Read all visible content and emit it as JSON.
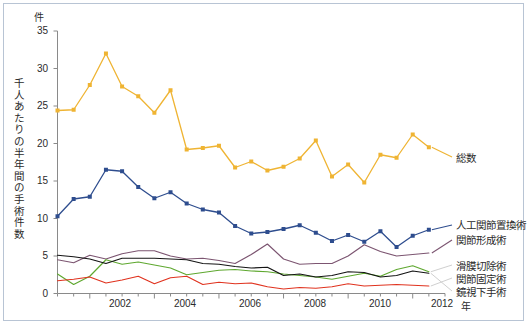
{
  "axes": {
    "unit_top": "件",
    "ylabel": "千人あたりの半年間の手術件数",
    "yticks": [
      "0",
      "5",
      "10",
      "15",
      "20",
      "25",
      "30",
      "35"
    ],
    "xticks": [
      "2002",
      "2004",
      "2006",
      "2008",
      "2010",
      "2012"
    ],
    "xunit": "年"
  },
  "legend": {
    "total": "総数",
    "arthroplasty": "人工関節置換術",
    "osteotomy": "関節形成術",
    "synovectomy": "滑膜切除術",
    "arthrodesis": "関節固定術",
    "arthroscopic": "鏡視下手術"
  },
  "colors": {
    "total": "#efb433",
    "arthroplasty": "#2e4d8e",
    "osteotomy": "#7c5571",
    "synovectomy": "#5fa830",
    "arthrodesis": "#e23川",
    "arthrodesis_hex": "#e0331f",
    "arthroscopic": "#141414",
    "frame": "#b8c4d4",
    "axis": "#8a8a8a",
    "text": "#2b2b2b"
  },
  "chart_data": {
    "type": "line",
    "title": "",
    "xlabel": "年",
    "ylabel": "千人あたりの半年間の手術件数",
    "ylim": [
      0,
      35
    ],
    "xlim": [
      2001.0,
      2013.0
    ],
    "grid": false,
    "legend_position": "right",
    "tick_interval_x": 2,
    "minor_tick_interval_x": 0.5,
    "tick_interval_y": 5,
    "x": [
      2001.0,
      2001.5,
      2002.0,
      2002.5,
      2003.0,
      2003.5,
      2004.0,
      2004.5,
      2005.0,
      2005.5,
      2006.0,
      2006.5,
      2007.0,
      2007.5,
      2008.0,
      2008.5,
      2009.0,
      2009.5,
      2010.0,
      2010.5,
      2011.0,
      2011.5,
      2012.0,
      2012.5
    ],
    "series": [
      {
        "name": "総数",
        "color": "#efb433",
        "markers": true,
        "values": [
          24.4,
          24.5,
          27.8,
          32.0,
          27.6,
          26.3,
          24.1,
          27.1,
          19.2,
          19.4,
          19.7,
          16.8,
          17.6,
          16.4,
          16.9,
          18.0,
          20.4,
          15.6,
          17.2,
          14.8,
          18.5,
          18.1,
          21.2,
          19.5
        ]
      },
      {
        "name": "人工関節置換術",
        "color": "#2e4d8e",
        "markers": true,
        "values": [
          10.3,
          12.6,
          12.9,
          16.5,
          16.3,
          14.2,
          12.7,
          13.5,
          12.0,
          11.2,
          10.8,
          9.0,
          8.0,
          8.2,
          8.6,
          9.1,
          8.1,
          7.0,
          7.8,
          6.9,
          8.3,
          6.2,
          7.7,
          8.5
        ]
      },
      {
        "name": "関節形成術",
        "color": "#7c5571",
        "markers": false,
        "values": [
          4.5,
          4.1,
          5.1,
          4.6,
          5.3,
          5.7,
          5.7,
          5.0,
          4.6,
          4.7,
          4.4,
          4.0,
          5.2,
          6.6,
          4.6,
          3.9,
          4.0,
          4.0,
          5.0,
          6.5,
          5.6,
          5.0,
          5.2,
          5.4
        ]
      },
      {
        "name": "滑膜切除術",
        "color": "#5fa830",
        "markers": false,
        "values": [
          2.6,
          1.2,
          2.3,
          4.5,
          3.9,
          4.2,
          3.8,
          3.4,
          2.5,
          2.8,
          3.1,
          3.2,
          3.0,
          2.9,
          2.6,
          2.4,
          2.2,
          1.9,
          2.3,
          2.7,
          2.3,
          3.2,
          3.7,
          2.9
        ]
      },
      {
        "name": "関節固定術",
        "color": "#e0331f",
        "markers": false,
        "values": [
          1.7,
          1.9,
          2.2,
          1.4,
          1.8,
          2.3,
          1.3,
          2.1,
          2.3,
          1.2,
          1.5,
          1.3,
          1.4,
          0.9,
          0.6,
          0.8,
          0.7,
          0.9,
          1.3,
          1.0,
          1.1,
          1.2,
          1.1,
          1.0
        ]
      },
      {
        "name": "鏡視下手術",
        "color": "#141414",
        "markers": false,
        "values": [
          5.1,
          4.9,
          4.6,
          4.0,
          4.7,
          4.7,
          4.7,
          4.6,
          4.5,
          4.0,
          3.9,
          3.6,
          3.4,
          3.5,
          2.4,
          2.6,
          2.2,
          2.4,
          2.9,
          2.8,
          2.2,
          2.4,
          3.0,
          2.7
        ]
      }
    ]
  }
}
